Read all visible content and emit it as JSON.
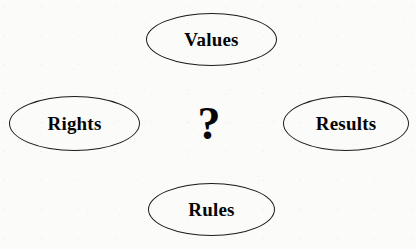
{
  "diagram": {
    "type": "concept-map",
    "background_color": "#fbfbfa",
    "stroke_color": "#1b1b1b",
    "text_color": "#050505",
    "center": {
      "symbol": "?",
      "icon_name": "question-mark-glyph"
    },
    "nodes": [
      {
        "id": "values",
        "label": "Values",
        "shape": "ellipse",
        "position": "top"
      },
      {
        "id": "rights",
        "label": "Rights",
        "shape": "ellipse",
        "position": "left"
      },
      {
        "id": "results",
        "label": "Results",
        "shape": "ellipse",
        "position": "right"
      },
      {
        "id": "rules",
        "label": "Rules",
        "shape": "ellipse",
        "position": "bottom"
      }
    ]
  }
}
